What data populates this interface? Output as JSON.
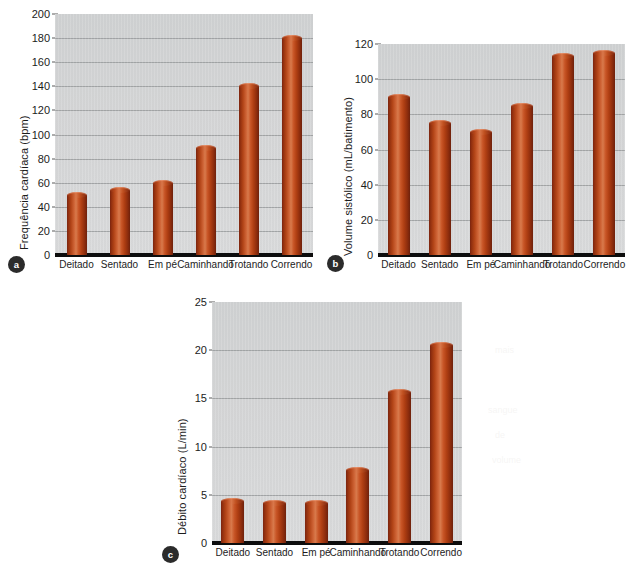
{
  "page": {
    "background": "#ffffff",
    "bar_color": "#b8441a",
    "plot_background": "#d4d5d6",
    "gridline_color": "#9a9c9e",
    "axis_color": "#0d0d0d"
  },
  "panels": [
    {
      "badge": "a"
    },
    {
      "badge": "b"
    },
    {
      "badge": "c"
    }
  ],
  "chart_data": [
    {
      "type": "bar",
      "panel": "a",
      "title": "",
      "xlabel": "",
      "ylabel": "Frequência cardíaca (bpm)",
      "categories": [
        "Deitado",
        "Sentado",
        "Em pé",
        "Caminhando",
        "Trotando",
        "Correndo"
      ],
      "values": [
        50,
        54,
        60,
        89,
        140,
        180
      ],
      "yticks": [
        0,
        20,
        40,
        60,
        80,
        100,
        120,
        140,
        160,
        180,
        200
      ],
      "ylim": [
        0,
        200
      ],
      "grid": true,
      "legend": "none"
    },
    {
      "type": "bar",
      "panel": "b",
      "title": "",
      "xlabel": "",
      "ylabel": "Volume sistólico (mL/batimento)",
      "categories": [
        "Deitado",
        "Sentado",
        "Em pé",
        "Caminhando",
        "Trotando",
        "Correndo"
      ],
      "values": [
        90,
        75,
        70,
        85,
        113,
        115
      ],
      "yticks": [
        0,
        20,
        40,
        60,
        80,
        100,
        120
      ],
      "ylim": [
        0,
        120
      ],
      "grid": true,
      "legend": "none"
    },
    {
      "type": "bar",
      "panel": "c",
      "title": "",
      "xlabel": "",
      "ylabel": "Débito cardíaco (L/min)",
      "categories": [
        "Deitado",
        "Sentado",
        "Em pé",
        "Caminhando",
        "Trotando",
        "Correndo"
      ],
      "values": [
        4.4,
        4.1,
        4.1,
        7.6,
        15.7,
        20.5
      ],
      "yticks": [
        0,
        5,
        10,
        15,
        20,
        25
      ],
      "ylim": [
        0,
        25
      ],
      "grid": true,
      "legend": "none"
    }
  ]
}
